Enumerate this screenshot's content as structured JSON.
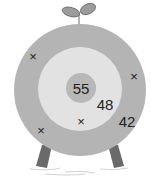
{
  "diagram": {
    "type": "target-board",
    "colors": {
      "outer_ring": "#b4b4b4",
      "middle_ring": "#e2e2e2",
      "center": "#b8b8b8",
      "legs": "#6a6a6a",
      "sprout": "#9c9c9c",
      "text": "#222222"
    },
    "scores": {
      "center": "55",
      "middle_ring": "48",
      "outer_ring": "42"
    },
    "marks": [
      {
        "symbol": "×",
        "x": 33,
        "y": 56
      },
      {
        "symbol": "×",
        "x": 134,
        "y": 76
      },
      {
        "symbol": "×",
        "x": 81,
        "y": 121
      },
      {
        "symbol": "×",
        "x": 41,
        "y": 130
      }
    ]
  }
}
